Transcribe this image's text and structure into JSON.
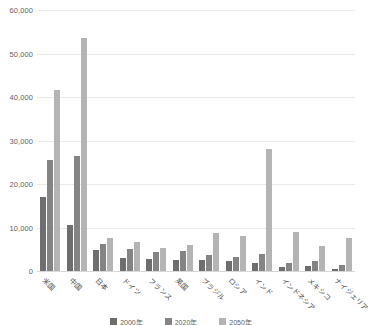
{
  "chart_data": {
    "type": "bar",
    "title": "",
    "xlabel": "",
    "ylabel": "",
    "ylim": [
      0,
      60000
    ],
    "ytick_labels": [
      "60,000",
      "50,000",
      "40,000",
      "30,000",
      "20,000",
      "10,000",
      "0"
    ],
    "ytick_values": [
      60000,
      50000,
      40000,
      30000,
      20000,
      10000,
      0
    ],
    "grid": true,
    "legend_position": "bottom",
    "categories": [
      "米国",
      "中国",
      "日本",
      "ドイツ",
      "フランス",
      "英国",
      "ブラジル",
      "ロシア",
      "インド",
      "インドネシア",
      "メキシコ",
      "ナイジェリア"
    ],
    "series": [
      {
        "name": "2000年",
        "color": "#6e6e6e",
        "values": [
          17000,
          10500,
          4800,
          2900,
          2800,
          2600,
          2500,
          2200,
          1800,
          1000,
          1200,
          500
        ]
      },
      {
        "name": "2020年",
        "color": "#848484",
        "values": [
          25500,
          26500,
          6300,
          5100,
          4400,
          4500,
          3600,
          3200,
          3900,
          1900,
          2300,
          1300
        ]
      },
      {
        "name": "2050年",
        "color": "#b4b4b4",
        "values": [
          41500,
          53500,
          7500,
          6600,
          5400,
          6000,
          8700,
          8000,
          28000,
          9000,
          5800,
          7600
        ]
      }
    ]
  }
}
